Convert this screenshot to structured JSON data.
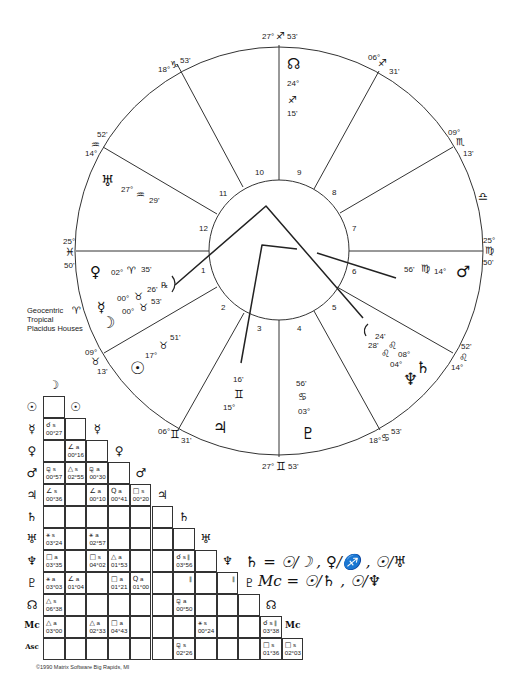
{
  "chart_info": {
    "lines": [
      "Geocentric",
      "Tropical",
      "Placidus Houses"
    ]
  },
  "copyright": "©1990 Matrix Software Big Rapids, MI",
  "cusps": [
    {
      "id": "mc",
      "deg": "27°",
      "sign": "♐",
      "min": "53'"
    },
    {
      "id": "c11",
      "deg": "18°",
      "sign": "♑",
      "min": "53'"
    },
    {
      "id": "c12",
      "deg": "14°",
      "sign": "♒",
      "min": "52'"
    },
    {
      "id": "asc",
      "deg": "25°",
      "sign": "♓",
      "min": "50'"
    },
    {
      "id": "c2",
      "deg": "09°",
      "sign": "♉",
      "min": "13'"
    },
    {
      "id": "c3",
      "deg": "06°",
      "sign": "♊",
      "min": "31'"
    },
    {
      "id": "ic",
      "deg": "27°",
      "sign": "♊",
      "min": "53'"
    },
    {
      "id": "c5",
      "deg": "18°",
      "sign": "♋",
      "min": "53'"
    },
    {
      "id": "c6",
      "deg": "14°",
      "sign": "♌",
      "min": "52'"
    },
    {
      "id": "dsc",
      "deg": "25°",
      "sign": "♍",
      "min": "50'"
    },
    {
      "id": "c8",
      "deg": "09°",
      "sign": "♏",
      "min": "13'"
    },
    {
      "id": "c9",
      "deg": "06°",
      "sign": "♐",
      "min": "31'"
    }
  ],
  "intercepted": {
    "aries": "♈",
    "libra": "♎"
  },
  "houses": [
    "1",
    "2",
    "3",
    "4",
    "5",
    "6",
    "7",
    "8",
    "9",
    "10",
    "11",
    "12"
  ],
  "planets": [
    {
      "id": "node",
      "glyph": "☊",
      "deg": "24°",
      "sign": "♐",
      "min": "15'"
    },
    {
      "id": "uranus",
      "glyph": "♅",
      "deg": "27°",
      "sign": "♒",
      "min": "29'"
    },
    {
      "id": "venus",
      "glyph": "♀",
      "deg": "02°",
      "sign": "♈",
      "min": "35'"
    },
    {
      "id": "mercury",
      "glyph": "☿",
      "deg": "00°",
      "sign": "♉",
      "min": "26'",
      "retro": "℞"
    },
    {
      "id": "moon",
      "glyph": "☽",
      "deg": "00°",
      "sign": "♉",
      "min": "53'"
    },
    {
      "id": "sun",
      "glyph": "☉",
      "deg": "17°",
      "sign": "♉",
      "min": "51'"
    },
    {
      "id": "jupiter",
      "glyph": "♃",
      "deg": "15°",
      "sign": "♊",
      "min": "16'"
    },
    {
      "id": "pluto",
      "glyph": "♇",
      "deg": "03°",
      "sign": "♋",
      "min": "56'"
    },
    {
      "id": "saturn",
      "glyph": "♄",
      "deg": "08°",
      "sign": "♌",
      "min": "24'"
    },
    {
      "id": "neptune",
      "glyph": "♆",
      "deg": "04°",
      "sign": "♌",
      "min": "28'"
    },
    {
      "id": "mars",
      "glyph": "♂",
      "deg": "14°",
      "sign": "♍",
      "min": "56'"
    }
  ],
  "grid": {
    "columns": [
      "☽",
      "☉",
      "☿",
      "♀",
      "♂",
      "♃",
      "♄",
      "♅",
      "♆",
      "♇",
      "☊",
      "Mc"
    ],
    "rows": [
      "☉",
      "☿",
      "♀",
      "♂",
      "♃",
      "♄",
      "♅",
      "♆",
      "♇",
      "☊",
      "Mc",
      "Asc"
    ],
    "cells": [
      {
        "r": 1,
        "c": 0,
        "asp": "☌",
        "t": "s",
        "orb": "00°27"
      },
      {
        "r": 2,
        "c": 1,
        "asp": "∠",
        "t": "a",
        "orb": "00°16"
      },
      {
        "r": 3,
        "c": 0,
        "asp": "⚼",
        "t": "s",
        "orb": "00°57"
      },
      {
        "r": 3,
        "c": 1,
        "asp": "△",
        "t": "s",
        "orb": "02°55"
      },
      {
        "r": 3,
        "c": 2,
        "asp": "⚼",
        "t": "a",
        "orb": "00°30"
      },
      {
        "r": 4,
        "c": 0,
        "asp": "∠",
        "t": "s",
        "orb": "00°36"
      },
      {
        "r": 4,
        "c": 2,
        "asp": "∠",
        "t": "a",
        "orb": "00°10"
      },
      {
        "r": 4,
        "c": 3,
        "asp": "Q",
        "t": "a",
        "orb": "00°41"
      },
      {
        "r": 4,
        "c": 4,
        "asp": "□",
        "t": "s",
        "orb": "00°20"
      },
      {
        "r": 6,
        "c": 0,
        "asp": "⚹",
        "t": "s",
        "orb": "03°24"
      },
      {
        "r": 6,
        "c": 2,
        "asp": "⚹",
        "t": "a",
        "orb": "02°57"
      },
      {
        "r": 7,
        "c": 0,
        "asp": "□",
        "t": "a",
        "orb": "03°35"
      },
      {
        "r": 7,
        "c": 2,
        "asp": "□",
        "t": "s",
        "orb": "04°02"
      },
      {
        "r": 7,
        "c": 3,
        "asp": "△",
        "t": "a",
        "orb": "01°53"
      },
      {
        "r": 7,
        "c": 6,
        "asp": "☌",
        "t": "s ∥",
        "orb": "03°56"
      },
      {
        "r": 8,
        "c": 0,
        "asp": "⚹",
        "t": "a",
        "orb": "03°03"
      },
      {
        "r": 8,
        "c": 1,
        "asp": "∠",
        "t": "a",
        "orb": "01°04"
      },
      {
        "r": 8,
        "c": 3,
        "asp": "□",
        "t": "a",
        "orb": "01°21"
      },
      {
        "r": 8,
        "c": 4,
        "asp": "Q",
        "t": "a",
        "orb": "01°00"
      },
      {
        "r": 8,
        "c": 6,
        "asp": "",
        "t": "∥",
        "orb": ""
      },
      {
        "r": 8,
        "c": 8,
        "asp": "",
        "t": "∥",
        "orb": ""
      },
      {
        "r": 9,
        "c": 0,
        "asp": "△",
        "t": "s",
        "orb": "06°38"
      },
      {
        "r": 9,
        "c": 6,
        "asp": "⚼",
        "t": "a",
        "orb": "00°50"
      },
      {
        "r": 10,
        "c": 0,
        "asp": "△",
        "t": "a",
        "orb": "03°00"
      },
      {
        "r": 10,
        "c": 2,
        "asp": "△",
        "t": "a",
        "orb": "02°33"
      },
      {
        "r": 10,
        "c": 3,
        "asp": "□",
        "t": "a",
        "orb": "04°43"
      },
      {
        "r": 10,
        "c": 7,
        "asp": "⚹",
        "t": "s",
        "orb": "00°24"
      },
      {
        "r": 10,
        "c": 10,
        "asp": "☌",
        "t": "s ∥",
        "orb": "03°38"
      },
      {
        "r": 11,
        "c": 6,
        "asp": "⚼",
        "t": "s",
        "orb": "02°26"
      },
      {
        "r": 11,
        "c": 10,
        "asp": "□",
        "t": "s",
        "orb": "01°36"
      },
      {
        "r": 11,
        "c": 11,
        "asp": "□",
        "t": "s",
        "orb": "02°03"
      }
    ]
  },
  "handwritten_notes": [
    "♄ = ☉/☽ , ♀/♐ , ☉/♅",
    "Mc = ☉/♄ , ☉/♆"
  ]
}
